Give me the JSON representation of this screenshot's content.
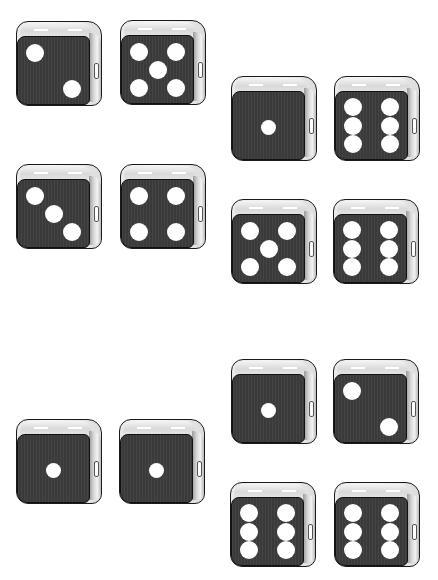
{
  "scene": {
    "description": "Groups of black six-sided dice with white pips",
    "colors": {
      "face": "#3a3a3a",
      "pip": "#ffffff",
      "bevel": "#e0e0e0",
      "outline": "#1a1a1a",
      "background": "#ffffff"
    }
  },
  "dice": [
    {
      "id": "die-1",
      "value": 2,
      "x": 16,
      "y": 21
    },
    {
      "id": "die-2",
      "value": 5,
      "x": 120,
      "y": 20
    },
    {
      "id": "die-3",
      "value": 1,
      "x": 231,
      "y": 76
    },
    {
      "id": "die-4",
      "value": 6,
      "x": 334,
      "y": 76
    },
    {
      "id": "die-5",
      "value": 3,
      "x": 16,
      "y": 164
    },
    {
      "id": "die-6",
      "value": 4,
      "x": 120,
      "y": 164
    },
    {
      "id": "die-7",
      "value": 5,
      "x": 231,
      "y": 199
    },
    {
      "id": "die-8",
      "value": 6,
      "x": 333,
      "y": 199
    },
    {
      "id": "die-9",
      "value": 1,
      "x": 231,
      "y": 359
    },
    {
      "id": "die-10",
      "value": 2,
      "x": 333,
      "y": 359
    },
    {
      "id": "die-11",
      "value": 1,
      "x": 16,
      "y": 419
    },
    {
      "id": "die-12",
      "value": 1,
      "x": 119,
      "y": 419
    },
    {
      "id": "die-13",
      "value": 6,
      "x": 230,
      "y": 482
    },
    {
      "id": "die-14",
      "value": 6,
      "x": 334,
      "y": 482
    }
  ]
}
